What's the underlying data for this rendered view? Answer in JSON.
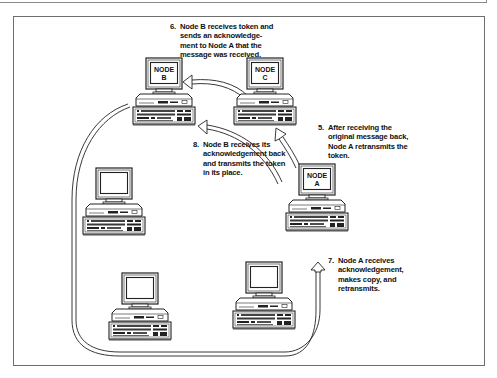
{
  "diagram": {
    "type": "token-ring-network-flow",
    "nodes": [
      {
        "id": "node-b",
        "label_line1": "NODE",
        "label_line2": "B"
      },
      {
        "id": "node-c",
        "label_line1": "NODE",
        "label_line2": "C"
      },
      {
        "id": "node-a",
        "label_line1": "NODE",
        "label_line2": "A"
      },
      {
        "id": "unlabeled-1",
        "label_line1": "",
        "label_line2": ""
      },
      {
        "id": "unlabeled-2",
        "label_line1": "",
        "label_line2": ""
      },
      {
        "id": "unlabeled-3",
        "label_line1": "",
        "label_line2": ""
      }
    ],
    "steps": [
      {
        "num": "5.",
        "text": "After receiving the\noriginal message back,\nNode A retransmits the\ntoken."
      },
      {
        "num": "6.",
        "text": "Node B receives token and\nsends an acknowledge-\nment to Node A that the\nmessage was received."
      },
      {
        "num": "7.",
        "text": "Node A receives\nacknowledgement,\nmakes copy, and\nretransmits."
      },
      {
        "num": "8.",
        "text": "Node B receives its\nacknowledgement back\nand transmits the token\nin its place."
      }
    ],
    "arrows": [
      {
        "from": "node-c",
        "to": "node-b",
        "step": "6"
      },
      {
        "from": "node-a",
        "to": "node-c",
        "step": "5"
      },
      {
        "from": "node-a",
        "to": "node-b",
        "step": "8"
      },
      {
        "from": "node-b",
        "to": "node-a",
        "via": "ring",
        "step": "7"
      }
    ],
    "colors": {
      "line": "#222222",
      "frame": "#6e6e6e",
      "background": "#ffffff"
    }
  }
}
